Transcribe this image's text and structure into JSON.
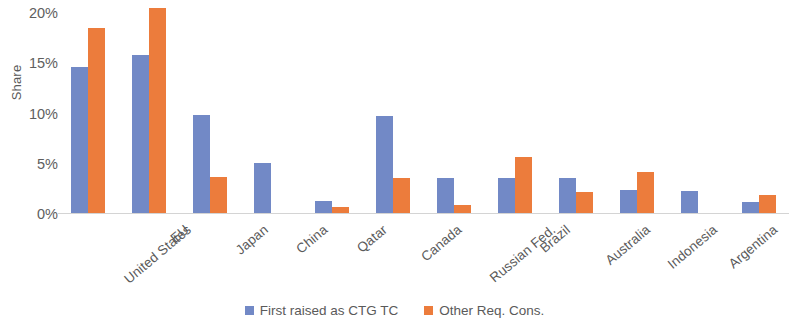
{
  "chart_data": {
    "type": "bar",
    "title": "",
    "xlabel": "",
    "ylabel": "Share",
    "ylim": [
      0,
      20
    ],
    "ytick_labels": [
      "20%",
      "15%",
      "10%",
      "5%",
      "0%"
    ],
    "ytick_values": [
      20,
      15,
      10,
      5,
      0
    ],
    "grid": false,
    "legend_position": "bottom",
    "categories": [
      "United States",
      "EU",
      "Japan",
      "China",
      "Qatar",
      "Canada",
      "Russian Fed.",
      "Brazil",
      "Australia",
      "Indonesia",
      "Argentina",
      "New Zealand"
    ],
    "series": [
      {
        "name": "First raised as CTG TC",
        "color": "#7289c6",
        "values": [
          14.5,
          15.7,
          9.8,
          5.0,
          1.2,
          9.7,
          3.5,
          3.5,
          3.5,
          2.3,
          2.2,
          1.1
        ]
      },
      {
        "name": "Other Req. Cons.",
        "color": "#ec7c3c",
        "values": [
          18.4,
          20.4,
          3.6,
          0,
          0.6,
          3.5,
          0.8,
          5.6,
          2.1,
          4.1,
          0,
          1.8
        ]
      }
    ]
  },
  "legend": {
    "items": [
      {
        "label": "First raised as CTG TC",
        "color": "#7289c6"
      },
      {
        "label": "Other Req. Cons.",
        "color": "#ec7c3c"
      }
    ]
  },
  "axis": {
    "y_title": "Share"
  }
}
